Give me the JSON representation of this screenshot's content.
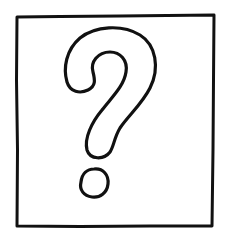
{
  "image": {
    "description": "Hand-drawn question mark inside a square frame",
    "symbol": "?",
    "icon": "question-mark-icon",
    "stroke_color": "#111111",
    "background_color": "#ffffff"
  }
}
